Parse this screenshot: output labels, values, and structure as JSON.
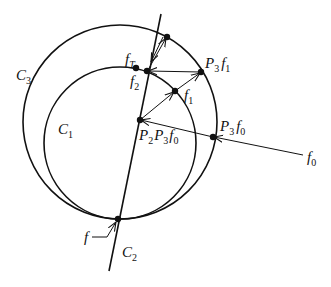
{
  "diagram": {
    "type": "geometric projection diagram",
    "circles": [
      {
        "id": "C3",
        "label": "C",
        "sub": "3",
        "cx": 120,
        "cy": 122,
        "r": 97
      },
      {
        "id": "C1",
        "label": "C",
        "sub": "1",
        "cx": 120,
        "cy": 143,
        "r": 76
      }
    ],
    "line": {
      "id": "C2",
      "label": "C",
      "sub": "2",
      "x1": 161,
      "y1": 14,
      "x2": 109,
      "y2": 271
    },
    "points": [
      {
        "id": "f",
        "label": "f",
        "x": 118,
        "y": 219
      },
      {
        "id": "P2P3f0",
        "label": "P",
        "x": 140,
        "y": 120
      },
      {
        "id": "f1",
        "label": "f",
        "x": 175,
        "y": 91
      },
      {
        "id": "P3f1",
        "label": "P",
        "x": 201,
        "y": 72
      },
      {
        "id": "f2",
        "label": "f",
        "x": 147,
        "y": 71
      },
      {
        "id": "fT",
        "label": "f",
        "x": 136,
        "y": 68
      },
      {
        "id": "top",
        "x": 167,
        "y": 37
      },
      {
        "id": "P3f0",
        "label": "P",
        "x": 213,
        "y": 137
      }
    ],
    "labels": {
      "C3": {
        "main": "C",
        "sub": "3"
      },
      "C1": {
        "main": "C",
        "sub": "1"
      },
      "C2": {
        "main": "C",
        "sub": "2"
      },
      "f": "f",
      "fT": {
        "main": "f",
        "sub": "T"
      },
      "f2": {
        "main": "f",
        "sub": "2"
      },
      "f1": {
        "main": "f",
        "sub": "1"
      },
      "f0": {
        "main": "f",
        "sub": "0"
      },
      "P3f1": {
        "p": "P",
        "psub": "3",
        "f": "f",
        "fsub": "1"
      },
      "P3f0": {
        "p": "P",
        "psub": "3",
        "f": "f",
        "fsub": "0"
      },
      "P2P3f0": {
        "p1": "P",
        "p1sub": "2",
        "p2": "P",
        "p2sub": "3",
        "f": "f",
        "fsub": "0"
      }
    },
    "colors": {
      "stroke": "#111111",
      "background": "#ffffff"
    }
  }
}
